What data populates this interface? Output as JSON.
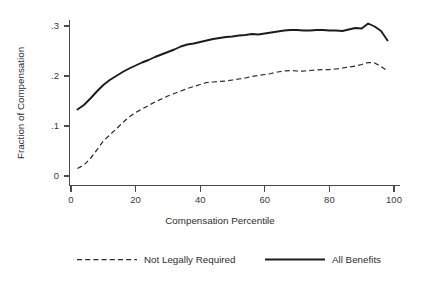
{
  "chart_data": {
    "type": "line",
    "title": "",
    "xlabel": "Compensation Percentile",
    "ylabel": "Fraction of Compensation",
    "xlim": [
      0,
      100
    ],
    "ylim": [
      0,
      0.32
    ],
    "xticks": [
      0,
      20,
      40,
      60,
      80,
      100
    ],
    "xticklabels": [
      "0",
      "20",
      "40",
      "60",
      "80",
      "100"
    ],
    "yticks": [
      0,
      0.1,
      0.2,
      0.3
    ],
    "yticklabels": [
      "0",
      ".1",
      ".2",
      ".3"
    ],
    "grid": false,
    "legend_position": "below-plot",
    "series": [
      {
        "name": "Not Legally Required",
        "style": "dashed",
        "color": "#2a2a2a",
        "x": [
          2,
          4,
          6,
          8,
          10,
          12,
          14,
          16,
          18,
          20,
          22,
          24,
          26,
          28,
          30,
          32,
          34,
          36,
          38,
          40,
          42,
          44,
          46,
          48,
          50,
          52,
          54,
          56,
          58,
          60,
          62,
          64,
          66,
          68,
          70,
          72,
          74,
          76,
          78,
          80,
          82,
          84,
          86,
          88,
          90,
          92,
          94,
          96,
          98
        ],
        "values": [
          0.015,
          0.022,
          0.035,
          0.052,
          0.07,
          0.082,
          0.094,
          0.107,
          0.118,
          0.127,
          0.134,
          0.141,
          0.148,
          0.154,
          0.16,
          0.165,
          0.17,
          0.175,
          0.179,
          0.183,
          0.187,
          0.188,
          0.189,
          0.19,
          0.192,
          0.194,
          0.196,
          0.199,
          0.201,
          0.203,
          0.205,
          0.208,
          0.21,
          0.211,
          0.21,
          0.21,
          0.211,
          0.212,
          0.213,
          0.213,
          0.214,
          0.216,
          0.218,
          0.22,
          0.223,
          0.227,
          0.226,
          0.219,
          0.21
        ]
      },
      {
        "name": "All Benefits",
        "style": "solid",
        "color": "#1c1c1c",
        "x": [
          2,
          4,
          6,
          8,
          10,
          12,
          14,
          16,
          18,
          20,
          22,
          24,
          26,
          28,
          30,
          32,
          34,
          36,
          38,
          40,
          42,
          44,
          46,
          48,
          50,
          52,
          54,
          56,
          58,
          60,
          62,
          64,
          66,
          68,
          70,
          72,
          74,
          76,
          78,
          80,
          82,
          84,
          86,
          88,
          90,
          92,
          94,
          96,
          98
        ],
        "values": [
          0.133,
          0.142,
          0.155,
          0.169,
          0.182,
          0.192,
          0.2,
          0.208,
          0.215,
          0.221,
          0.227,
          0.232,
          0.238,
          0.243,
          0.248,
          0.253,
          0.259,
          0.263,
          0.265,
          0.268,
          0.271,
          0.274,
          0.276,
          0.278,
          0.279,
          0.281,
          0.282,
          0.284,
          0.283,
          0.285,
          0.287,
          0.289,
          0.291,
          0.292,
          0.292,
          0.291,
          0.291,
          0.292,
          0.292,
          0.291,
          0.291,
          0.29,
          0.293,
          0.296,
          0.295,
          0.305,
          0.299,
          0.29,
          0.271
        ]
      }
    ],
    "legend": [
      {
        "label": "Not Legally Required",
        "style": "dashed"
      },
      {
        "label": "All Benefits",
        "style": "solid"
      }
    ]
  }
}
